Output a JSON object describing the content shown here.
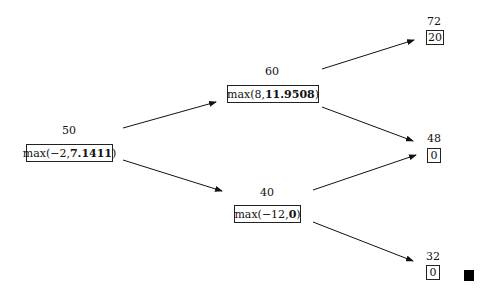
{
  "diagram": {
    "type": "binomial-tree",
    "nodes": [
      {
        "id": "root",
        "value_label": "50",
        "fn": "max(",
        "a": "−2",
        "sep": ", ",
        "b": "7.1411",
        "close": ")"
      },
      {
        "id": "up",
        "value_label": "60",
        "fn": "max(",
        "a": "8",
        "sep": ", ",
        "b": "11.9508",
        "close": ")"
      },
      {
        "id": "down",
        "value_label": "40",
        "fn": "max(",
        "a": "−12",
        "sep": ", ",
        "b": "0",
        "close": ")"
      },
      {
        "id": "uu",
        "value_label": "72",
        "payoff": "20"
      },
      {
        "id": "ud",
        "value_label": "48",
        "payoff": "0"
      },
      {
        "id": "dd",
        "value_label": "32",
        "payoff": "0"
      }
    ],
    "edges": [
      {
        "from": "root",
        "to": "up"
      },
      {
        "from": "root",
        "to": "down"
      },
      {
        "from": "up",
        "to": "uu"
      },
      {
        "from": "up",
        "to": "ud"
      },
      {
        "from": "down",
        "to": "ud"
      },
      {
        "from": "down",
        "to": "dd"
      }
    ],
    "end_marker": "qed-square"
  }
}
